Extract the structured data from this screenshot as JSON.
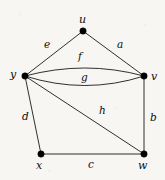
{
  "figure": {
    "kind": "undirected-multigraph-drawing",
    "background_color": "#f7f6f3",
    "ink_color": "#1a1a1a",
    "width": 165,
    "height": 180
  },
  "vertices": [
    {
      "id": "u",
      "label": "u",
      "x": 83,
      "y": 31,
      "label_x": 79,
      "label_y": 14
    },
    {
      "id": "y",
      "label": "y",
      "x": 25,
      "y": 76,
      "label_x": 10,
      "label_y": 69
    },
    {
      "id": "v",
      "label": "v",
      "x": 144,
      "y": 76,
      "label_x": 151,
      "label_y": 71
    },
    {
      "id": "x",
      "label": "x",
      "x": 41,
      "y": 154,
      "label_x": 36,
      "label_y": 160
    },
    {
      "id": "w",
      "label": "w",
      "x": 144,
      "y": 154,
      "label_x": 138,
      "label_y": 160
    }
  ],
  "edges": [
    {
      "id": "e",
      "label": "e",
      "from": "y",
      "to": "u",
      "shape": "straight",
      "label_x": 44,
      "label_y": 39
    },
    {
      "id": "a",
      "label": "a",
      "from": "u",
      "to": "v",
      "shape": "straight",
      "label_x": 117,
      "label_y": 39
    },
    {
      "id": "f",
      "label": "f",
      "from": "y",
      "to": "v",
      "shape": "arc-up",
      "label_x": 78,
      "label_y": 51
    },
    {
      "id": "g",
      "label": "g",
      "from": "y",
      "to": "v",
      "shape": "arc-down",
      "label_x": 81,
      "label_y": 72
    },
    {
      "id": "d",
      "label": "d",
      "from": "y",
      "to": "x",
      "shape": "straight",
      "label_x": 22,
      "label_y": 111
    },
    {
      "id": "h",
      "label": "h",
      "from": "y",
      "to": "w",
      "shape": "straight",
      "label_x": 99,
      "label_y": 105
    },
    {
      "id": "b",
      "label": "b",
      "from": "v",
      "to": "w",
      "shape": "straight",
      "label_x": 150,
      "label_y": 112
    },
    {
      "id": "c",
      "label": "c",
      "from": "x",
      "to": "w",
      "shape": "straight",
      "label_x": 88,
      "label_y": 159
    }
  ],
  "geometry": {
    "vertex_radius": 3.2,
    "arc_up_control": {
      "x": 85,
      "y": 60
    },
    "arc_down_control": {
      "x": 85,
      "y": 95
    }
  }
}
